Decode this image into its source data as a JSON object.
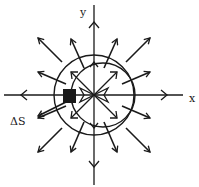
{
  "figure": {
    "type": "vector-field-diagram",
    "colors": {
      "ink": "#1a1a1a",
      "background": "#ffffff"
    },
    "axes": {
      "x_label": "x",
      "y_label": "y"
    },
    "annotations": {
      "surface_element_label": "ΔS"
    },
    "elements": {
      "origin": [
        94,
        95
      ],
      "circle_centered": {
        "cx": 94,
        "cy": 95,
        "r": 40
      },
      "circle_offset": {
        "cx": 103,
        "cy": 95,
        "r": 32
      },
      "surface_element": {
        "x": 63,
        "y": 88,
        "w": 13,
        "h": 14
      },
      "arrow_directions_deg": [
        0,
        22.5,
        45,
        67.5,
        90,
        112.5,
        135,
        157.5,
        180,
        202.5,
        225,
        247.5,
        270,
        292.5,
        315,
        337.5
      ]
    }
  }
}
